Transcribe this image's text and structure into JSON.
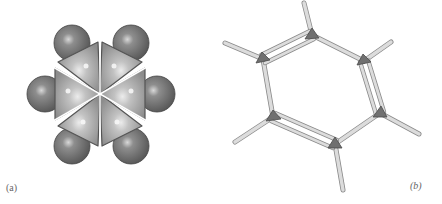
{
  "figure": {
    "panels": [
      {
        "id": "a",
        "label": "(a)",
        "model": "space-filling",
        "carbon_count": 6,
        "hydrogen_count": 6,
        "colors": {
          "carbon": "#b8b8b8",
          "hydrogen": "#7a7a7a",
          "outline": "#4a4a4a"
        }
      },
      {
        "id": "b",
        "label": "(b)",
        "model": "ball-and-stick (Kekulé structure)",
        "carbon_count": 6,
        "hydrogen_count": 6,
        "double_bonds": 3,
        "colors": {
          "carbon": "#6e6e6e",
          "bond": "#d0d0d0",
          "bond_outline": "#8a8a8a"
        }
      }
    ]
  }
}
